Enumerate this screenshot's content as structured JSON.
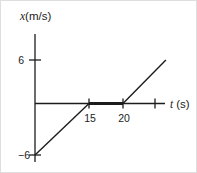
{
  "figure": {
    "y_axis_title": {
      "variable": "x",
      "units": "(m/s)"
    },
    "x_axis_title": {
      "variable": "t",
      "units": "(s)"
    }
  },
  "colors": {
    "line": "#1c1c1c",
    "background": "#ffffff",
    "border": "#dedede"
  },
  "chart_data": {
    "type": "line",
    "title": "",
    "xlabel": "t (s)",
    "ylabel": "x (m/s)",
    "xlim": [
      0,
      27
    ],
    "ylim": [
      -6,
      6
    ],
    "grid": false,
    "legend": false,
    "x_ticks": [
      {
        "value": 15,
        "label": "15"
      },
      {
        "value": 20,
        "label": "20"
      },
      {
        "value": 25,
        "label": ""
      }
    ],
    "y_ticks": [
      {
        "value": 6,
        "label": "6",
        "label_right_px": 23
      },
      {
        "value": -6,
        "label": "−6",
        "label_right_px": 29
      }
    ],
    "series": [
      {
        "name": "segment-rising-initial",
        "points": [
          [
            0,
            -6
          ],
          [
            15,
            0
          ]
        ],
        "stroke_width": 1.4
      },
      {
        "name": "segment-zero-thick",
        "points": [
          [
            15,
            0
          ],
          [
            20,
            0
          ]
        ],
        "stroke_width": 3.2
      },
      {
        "name": "segment-rising-final",
        "points": [
          [
            20,
            0
          ],
          [
            26.7,
            6
          ]
        ],
        "stroke_width": 1.4
      }
    ],
    "layout": {
      "t_anchors": [
        [
          0,
          34
        ],
        [
          15,
          88
        ],
        [
          20,
          122
        ],
        [
          25,
          154
        ]
      ],
      "x_anchors": [
        [
          -6,
          154
        ],
        [
          0,
          102.5
        ],
        [
          6,
          59
        ]
      ],
      "y_axis": {
        "x": 34,
        "y_top": 33,
        "y_bottom": 161
      },
      "x_axis": {
        "y": 102.5,
        "x_left": 34,
        "x_right": 164
      },
      "axis_stroke_width": 1.3,
      "x_tick_half": 5,
      "y_tick_half": 6,
      "x_tick_label_dx": 1,
      "x_tick_label_dy": 18,
      "y_tick_label_dy": 4
    }
  }
}
